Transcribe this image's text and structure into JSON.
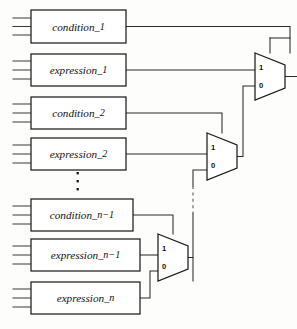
{
  "figure": {
    "background_color": "#fdfdfc",
    "line_color": "#2b2b2b",
    "box_fill": "#ffffff",
    "width": 297,
    "height": 329
  },
  "boxes": [
    {
      "id": "condition_1",
      "label": "condition",
      "subscript": "_1",
      "x": 31,
      "y": 10,
      "w": 95,
      "h": 33,
      "input_stubs": 3
    },
    {
      "id": "expression_1",
      "label": "expression",
      "subscript": "_1",
      "x": 31,
      "y": 54,
      "w": 95,
      "h": 32,
      "input_stubs": 3
    },
    {
      "id": "condition_2",
      "label": "condition",
      "subscript": "_2",
      "x": 31,
      "y": 97,
      "w": 95,
      "h": 32,
      "input_stubs": 3
    },
    {
      "id": "expression_2",
      "label": "expression",
      "subscript": "_2",
      "x": 31,
      "y": 138,
      "w": 95,
      "h": 32,
      "input_stubs": 3
    },
    {
      "id": "condition_n_1",
      "label": "condition",
      "subscript": "_n−1",
      "x": 31,
      "y": 199,
      "w": 102,
      "h": 32,
      "input_stubs": 3
    },
    {
      "id": "expression_n_1",
      "label": "expression",
      "subscript": "_n−1",
      "x": 31,
      "y": 239,
      "w": 109,
      "h": 32,
      "input_stubs": 3
    },
    {
      "id": "expression_n",
      "label": "expression",
      "subscript": "_n",
      "x": 31,
      "y": 282,
      "w": 109,
      "h": 32,
      "input_stubs": 3
    }
  ],
  "multiplexers": [
    {
      "id": "mux_1",
      "x": 255,
      "y": 53,
      "w": 30,
      "h": 47,
      "port_high": "1",
      "port_low": "0"
    },
    {
      "id": "mux_2",
      "x": 207,
      "y": 133,
      "w": 30,
      "h": 47,
      "port_high": "1",
      "port_low": "0"
    },
    {
      "id": "mux_3",
      "x": 158,
      "y": 234,
      "w": 30,
      "h": 47,
      "port_high": "1",
      "port_low": "0"
    }
  ],
  "ellipsis": {
    "x": 78,
    "y": 172,
    "dots": 3,
    "orientation": "vertical"
  },
  "output": {
    "id": "final-output",
    "label": ""
  }
}
